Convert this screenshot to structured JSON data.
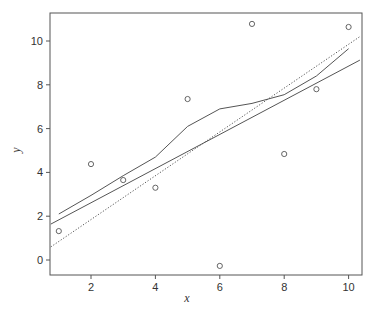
{
  "chart_data": {
    "type": "scatter",
    "title": "",
    "xlabel": "x",
    "ylabel": "y",
    "xlim": [
      0.75,
      10.35
    ],
    "ylim": [
      -0.7,
      11.2
    ],
    "x_ticks": [
      2,
      4,
      6,
      8,
      10
    ],
    "y_ticks": [
      0,
      2,
      4,
      6,
      8,
      10
    ],
    "grid": false,
    "legend": null,
    "points": {
      "x": [
        1,
        2,
        3,
        4,
        5,
        6,
        7,
        8,
        9,
        10
      ],
      "y": [
        1.32,
        4.38,
        3.65,
        3.3,
        7.35,
        -0.27,
        10.78,
        4.84,
        7.8,
        10.64
      ]
    },
    "series": [
      {
        "name": "least-squares regression line",
        "style": "solid",
        "x": [
          0.75,
          10.35
        ],
        "y": [
          1.64,
          9.13
        ]
      },
      {
        "name": "smooth curve",
        "style": "solid",
        "x": [
          1,
          2,
          3,
          4,
          5,
          6,
          7,
          8,
          9,
          10
        ],
        "y": [
          2.1,
          2.95,
          3.85,
          4.7,
          6.1,
          6.9,
          7.15,
          7.55,
          8.4,
          9.65
        ]
      },
      {
        "name": "reference line",
        "style": "dotted",
        "x": [
          0.75,
          10.35
        ],
        "y": [
          0.6,
          10.2
        ]
      }
    ]
  },
  "axes": {
    "x_title": "x",
    "y_title": "y",
    "x_tick_labels": [
      "2",
      "4",
      "6",
      "8",
      "10"
    ],
    "y_tick_labels": [
      "0",
      "2",
      "4",
      "6",
      "8",
      "10"
    ]
  },
  "colors": {
    "axis": "#555555",
    "line": "#555555",
    "points": "#555555",
    "text": "#333333"
  }
}
